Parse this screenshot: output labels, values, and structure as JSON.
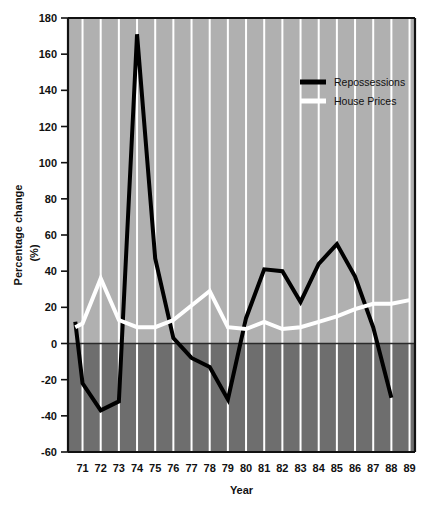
{
  "chart_data": {
    "type": "line",
    "title": "",
    "xlabel": "Year",
    "ylabel": "Percentage change (%)",
    "ylabel_line1": "Percentage change",
    "ylabel_line2": "(%)",
    "xlim": [
      70.2,
      89.3
    ],
    "ylim": [
      -60,
      180
    ],
    "ytick_step": 20,
    "yticks": [
      180,
      160,
      140,
      120,
      100,
      80,
      60,
      40,
      20,
      0,
      -20,
      -40,
      -60
    ],
    "ytick_labels": [
      "180",
      "160",
      "140",
      "120",
      "100",
      "80",
      "60",
      "40",
      "20",
      "0",
      "-20",
      "-40",
      "-60"
    ],
    "categories": [
      71,
      72,
      73,
      74,
      75,
      76,
      77,
      78,
      79,
      80,
      81,
      82,
      83,
      84,
      85,
      86,
      87,
      88,
      89
    ],
    "xtick_labels": [
      "71",
      "72",
      "73",
      "74",
      "75",
      "76",
      "77",
      "78",
      "79",
      "80",
      "81",
      "82",
      "83",
      "84",
      "85",
      "86",
      "87",
      "88",
      "89"
    ],
    "grid": "vertical-white",
    "legend_position": "top-right-inside",
    "zero_line": 0,
    "background_above_zero": "#b0b0b0",
    "background_below_zero": "#6e6e6e",
    "series": [
      {
        "name": "Repossessions",
        "color": "#000000",
        "x": [
          70.6,
          71,
          72,
          73,
          74,
          75,
          76,
          77,
          78,
          79,
          80,
          81,
          82,
          83,
          84,
          85,
          86,
          87,
          88
        ],
        "values": [
          12,
          -22,
          -37,
          -32,
          171,
          47,
          3,
          -8,
          -13,
          -31,
          14,
          41,
          40,
          23,
          44,
          55,
          37,
          9,
          -30
        ]
      },
      {
        "name": "House Prices",
        "color": "#ffffff",
        "x": [
          70.6,
          71,
          72,
          73,
          74,
          75,
          76,
          77,
          78,
          79,
          80,
          81,
          82,
          83,
          84,
          85,
          86,
          87,
          88,
          89
        ],
        "values": [
          9,
          11,
          36,
          13,
          9,
          9,
          13,
          21,
          29,
          9,
          8,
          12,
          8,
          9,
          12,
          15,
          19,
          22,
          22,
          24
        ]
      }
    ]
  },
  "legend": {
    "items": [
      {
        "label": "Repossessions",
        "color": "#000000"
      },
      {
        "label": "House Prices",
        "color": "#ffffff"
      }
    ]
  }
}
